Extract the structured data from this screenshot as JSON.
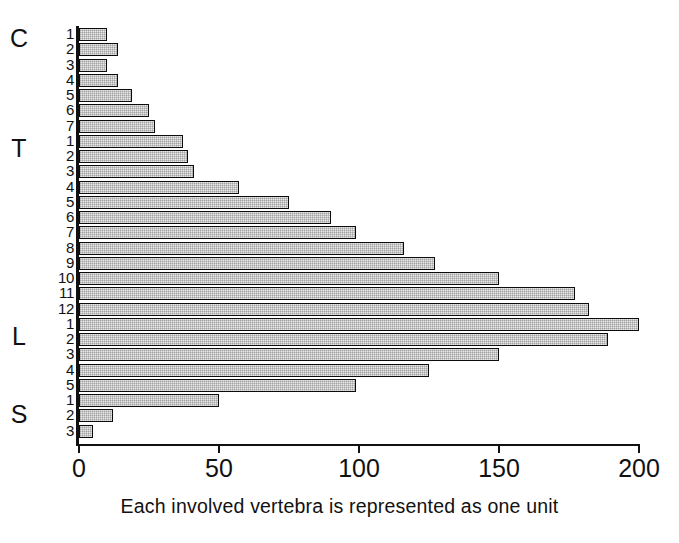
{
  "chart_data": {
    "type": "bar",
    "orientation": "horizontal",
    "title": "",
    "subtitle": "",
    "caption": "Each involved vertebra is represented as one unit",
    "xlabel": "",
    "ylabel": "",
    "xlim": [
      0,
      200
    ],
    "xticks": [
      0,
      50,
      100,
      150,
      200
    ],
    "xtick_labels": [
      "0",
      "50",
      "100",
      "150",
      "200"
    ],
    "grid": false,
    "legend": null,
    "bar_facecolor": "#e9e9e9",
    "bar_edgecolor": "#0c0c0c",
    "groups": [
      {
        "label": "C",
        "count": 7
      },
      {
        "label": "T",
        "count": 12
      },
      {
        "label": "L",
        "count": 5
      },
      {
        "label": "S",
        "count": 3
      }
    ],
    "categories": [
      "C1",
      "C2",
      "C3",
      "C4",
      "C5",
      "C6",
      "C7",
      "T1",
      "T2",
      "T3",
      "T4",
      "T5",
      "T6",
      "T7",
      "T8",
      "T9",
      "T10",
      "T11",
      "T12",
      "L1",
      "L2",
      "L3",
      "L4",
      "L5",
      "S1",
      "S2",
      "S3"
    ],
    "tick_labels": [
      "1",
      "2",
      "3",
      "4",
      "5",
      "6",
      "7",
      "1",
      "2",
      "3",
      "4",
      "5",
      "6",
      "7",
      "8",
      "9",
      "10",
      "11",
      "12",
      "1",
      "2",
      "3",
      "4",
      "5",
      "1",
      "2",
      "3"
    ],
    "values": [
      10,
      14,
      10,
      14,
      19,
      25,
      27,
      37,
      39,
      41,
      57,
      75,
      90,
      99,
      116,
      127,
      150,
      177,
      182,
      200,
      189,
      150,
      125,
      99,
      50,
      12,
      5
    ]
  }
}
